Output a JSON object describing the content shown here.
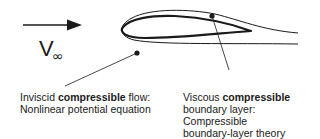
{
  "figure": {
    "freestream": {
      "symbol": "V",
      "subscript": "∞",
      "arrow_direction": "right"
    },
    "annotations": [
      {
        "id": "inviscid",
        "lines": [
          {
            "prefix": "Inviscid ",
            "bold": "compressible",
            "suffix": " flow:"
          },
          {
            "text": "Nonlinear potential equation"
          }
        ]
      },
      {
        "id": "viscous",
        "lines": [
          {
            "prefix": "Viscous ",
            "bold": "compressible",
            "suffix": ""
          },
          {
            "text": "boundary layer:"
          },
          {
            "text": "Compressible"
          },
          {
            "text": "boundary-layer theory"
          }
        ]
      }
    ],
    "colors": {
      "stroke": "#1a1a1a",
      "background": "#ffffff"
    }
  }
}
